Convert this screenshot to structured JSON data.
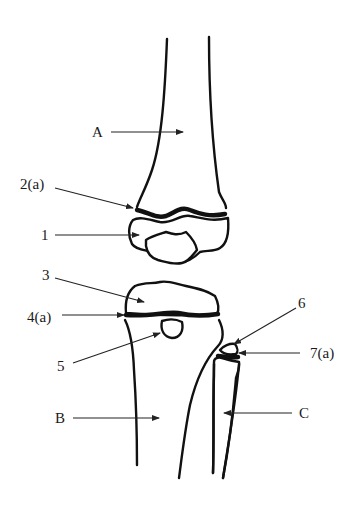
{
  "diagram": {
    "labels": {
      "A": "A",
      "B": "B",
      "C": "C",
      "l1": "1",
      "l2a": "2(a)",
      "l3": "3",
      "l4a": "4(a)",
      "l5": "5",
      "l6": "6",
      "l7a": "7(a)"
    },
    "colors": {
      "stroke": "#111111",
      "background": "#ffffff",
      "text": "#1a1a1a"
    }
  }
}
